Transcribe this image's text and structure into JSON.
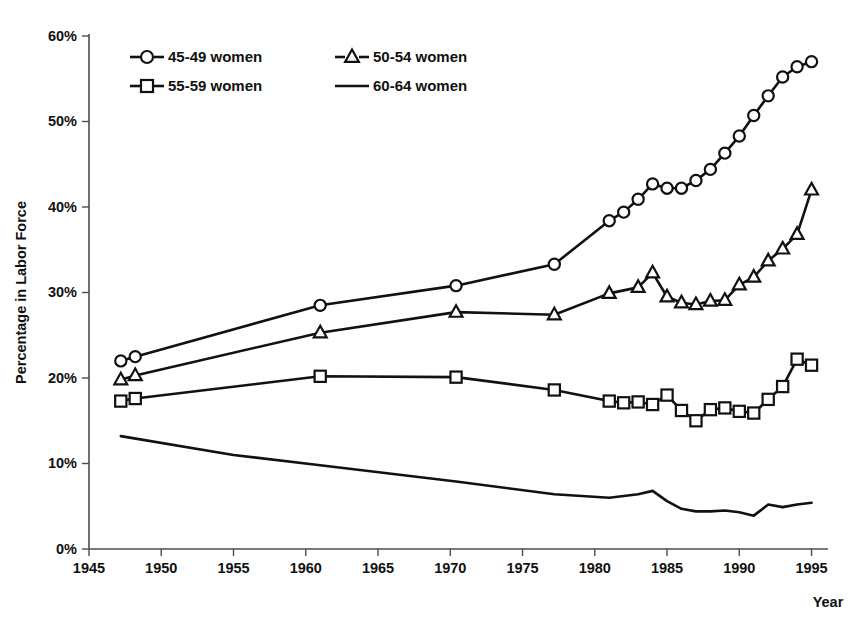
{
  "chart_data": {
    "type": "line",
    "title": "",
    "xlabel": "Year",
    "ylabel": "Percentage in Labor Force",
    "xlim": [
      1945,
      1996
    ],
    "ylim": [
      0,
      60
    ],
    "grid": false,
    "legend_position": "top-left-inside",
    "x_ticks": [
      "1945",
      "1950",
      "1955",
      "1960",
      "1965",
      "1970",
      "1975",
      "1980",
      "1985",
      "1990",
      "1995"
    ],
    "x_tick_values": [
      1945,
      1950,
      1955,
      1960,
      1965,
      1970,
      1975,
      1980,
      1985,
      1990,
      1995
    ],
    "y_ticks": [
      "0%",
      "10%",
      "20%",
      "30%",
      "40%",
      "50%",
      "60%"
    ],
    "y_tick_values": [
      0,
      10,
      20,
      30,
      40,
      50,
      60
    ],
    "series": [
      {
        "name": "45-49 women",
        "marker": "circle",
        "x": [
          1947.2,
          1948.2,
          1961.0,
          1970.4,
          1977.2,
          1981.0,
          1982.0,
          1983.0,
          1984.0,
          1985.0,
          1986.0,
          1987.0,
          1988.0,
          1989.0,
          1990.0,
          1991.0,
          1992.0,
          1993.0,
          1994.0,
          1995.0
        ],
        "values": [
          22.0,
          22.5,
          28.5,
          30.8,
          33.3,
          38.4,
          39.4,
          40.9,
          42.7,
          42.2,
          42.2,
          43.1,
          44.4,
          46.3,
          48.3,
          50.7,
          53.0,
          55.2,
          56.4,
          57.0
        ]
      },
      {
        "name": "50-54 women",
        "marker": "triangle",
        "x": [
          1947.2,
          1948.2,
          1961.0,
          1970.4,
          1977.2,
          1981.0,
          1983.0,
          1984.0,
          1985.0,
          1986.0,
          1987.0,
          1988.0,
          1989.0,
          1990.0,
          1991.0,
          1992.0,
          1993.0,
          1994.0,
          1995.0
        ],
        "values": [
          19.8,
          20.3,
          25.3,
          27.7,
          27.4,
          29.9,
          30.6,
          32.3,
          29.5,
          28.8,
          28.6,
          29.0,
          29.1,
          30.9,
          31.8,
          33.7,
          35.1,
          36.8,
          42.0
        ]
      },
      {
        "name": "55-59 women",
        "marker": "square",
        "x": [
          1947.2,
          1948.2,
          1961.0,
          1970.4,
          1977.2,
          1981.0,
          1982.0,
          1983.0,
          1984.0,
          1985.0,
          1986.0,
          1987.0,
          1988.0,
          1989.0,
          1990.0,
          1991.0,
          1992.0,
          1993.0,
          1994.0,
          1995.0
        ],
        "values": [
          17.3,
          17.6,
          20.2,
          20.1,
          18.6,
          17.3,
          17.1,
          17.2,
          16.9,
          18.0,
          16.2,
          15.0,
          16.3,
          16.5,
          16.1,
          15.9,
          17.5,
          19.0,
          22.2,
          21.5
        ]
      },
      {
        "name": "60-64 women",
        "marker": "none",
        "x": [
          1947.2,
          1955.0,
          1961.0,
          1970.4,
          1977.2,
          1981.0,
          1982.0,
          1983.0,
          1984.0,
          1985.0,
          1986.0,
          1987.0,
          1988.0,
          1989.0,
          1990.0,
          1991.0,
          1992.0,
          1993.0,
          1994.0,
          1995.0
        ],
        "values": [
          13.2,
          11.0,
          9.8,
          7.9,
          6.4,
          6.0,
          6.2,
          6.4,
          6.8,
          5.6,
          4.7,
          4.4,
          4.4,
          4.5,
          4.3,
          3.9,
          5.2,
          4.9,
          5.2,
          5.4
        ]
      }
    ]
  },
  "legend": {
    "entries": [
      {
        "label": "45-49 women",
        "marker": "circle"
      },
      {
        "label": "50-54 women",
        "marker": "triangle"
      },
      {
        "label": "55-59 women",
        "marker": "square"
      },
      {
        "label": "60-64 women",
        "marker": "none"
      }
    ]
  }
}
